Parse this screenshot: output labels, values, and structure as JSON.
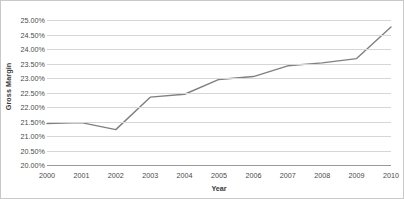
{
  "chart_data": {
    "type": "line",
    "title": "",
    "xlabel": "Year",
    "ylabel": "Gross Margin",
    "grid": true,
    "legend": false,
    "line_color": "#808080",
    "categories": [
      "2000",
      "2001",
      "2002",
      "2003",
      "2004",
      "2005",
      "2006",
      "2007",
      "2008",
      "2009",
      "2010"
    ],
    "x": [
      2000,
      2001,
      2002,
      2003,
      2004,
      2005,
      2006,
      2007,
      2008,
      2009,
      2010
    ],
    "values": [
      21.43,
      21.46,
      21.22,
      22.34,
      22.44,
      22.95,
      23.05,
      23.42,
      23.52,
      23.67,
      24.76
    ],
    "ylim": [
      20.0,
      25.0
    ],
    "ytick_values": [
      25.0,
      24.5,
      24.0,
      23.5,
      23.0,
      22.5,
      22.0,
      21.5,
      21.0,
      20.5,
      20.0
    ],
    "ytick_labels": [
      "25.00%",
      "24.50%",
      "24.00%",
      "23.50%",
      "23.00%",
      "22.50%",
      "22.00%",
      "21.50%",
      "21.00%",
      "20.50%",
      "20.00%"
    ],
    "xtick_labels": [
      "2000",
      "2001",
      "2002",
      "2003",
      "2004",
      "2005",
      "2006",
      "2007",
      "2008",
      "2009",
      "2010"
    ],
    "series": [
      {
        "name": "Gross Margin",
        "values": [
          21.43,
          21.46,
          21.22,
          22.34,
          22.44,
          22.95,
          23.05,
          23.42,
          23.52,
          23.67,
          24.76
        ]
      }
    ]
  },
  "colors": {
    "line": "#808080",
    "gridline": "#d6d6d6",
    "axis": "#9a9a9a",
    "text": "#4a4a4a",
    "border": "#c9c9c9",
    "background": "#ffffff"
  }
}
